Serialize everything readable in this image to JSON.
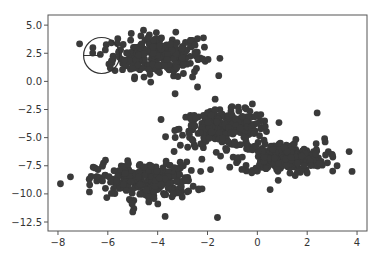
{
  "chart_data": {
    "type": "scatter",
    "title": "",
    "xlabel": "",
    "ylabel": "",
    "xlim": [
      -8.4,
      4.4
    ],
    "ylim": [
      -13.3,
      5.9
    ],
    "xticks": [
      -8,
      -6,
      -4,
      -2,
      0,
      2,
      4
    ],
    "yticks": [
      5.0,
      2.5,
      0.0,
      -2.5,
      -5.0,
      -7.5,
      -10.0,
      -12.5
    ],
    "xtick_labels": [
      "−8",
      "−6",
      "−4",
      "−2",
      "0",
      "2",
      "4"
    ],
    "ytick_labels": [
      "5.0",
      "2.5",
      "0.0",
      "−2.5",
      "−5.0",
      "−7.5",
      "−10.0",
      "−12.5"
    ],
    "grid": false,
    "legend": null,
    "marker_color": "#3a3a3a",
    "clusters": [
      {
        "name": "cluster-top-left",
        "center": [
          -4.0,
          2.3
        ],
        "spread": [
          0.9,
          0.9
        ],
        "n": 260
      },
      {
        "name": "cluster-middle",
        "center": [
          -1.3,
          -4.2
        ],
        "spread": [
          0.9,
          0.8
        ],
        "n": 260
      },
      {
        "name": "cluster-right",
        "center": [
          1.0,
          -6.8
        ],
        "spread": [
          0.85,
          0.7
        ],
        "n": 260
      },
      {
        "name": "cluster-bottom-left",
        "center": [
          -4.5,
          -8.8
        ],
        "spread": [
          1.0,
          0.8
        ],
        "n": 260
      }
    ],
    "outliers": [
      [
        -7.9,
        -9.1
      ],
      [
        -6.6,
        3.0
      ],
      [
        -6.1,
        2.8
      ],
      [
        -6.3,
        2.4
      ],
      [
        -5.9,
        1.2
      ],
      [
        -5.6,
        3.8
      ],
      [
        -2.4,
        3.8
      ],
      [
        -2.2,
        2.0
      ],
      [
        -2.6,
        0.4
      ],
      [
        -2.4,
        -0.5
      ],
      [
        -3.3,
        -1.1
      ],
      [
        2.7,
        -5.1
      ],
      [
        3.8,
        -8.0
      ],
      [
        3.2,
        -7.5
      ],
      [
        2.4,
        -2.8
      ],
      [
        -0.2,
        -2.0
      ],
      [
        -1.6,
        -12.1
      ],
      [
        -3.7,
        -12.0
      ],
      [
        -5.0,
        -11.6
      ]
    ],
    "annotations": [
      {
        "type": "circle",
        "center": [
          -6.25,
          2.3
        ],
        "radius_px": 18,
        "with_radius_line": true
      }
    ]
  },
  "caption": ""
}
